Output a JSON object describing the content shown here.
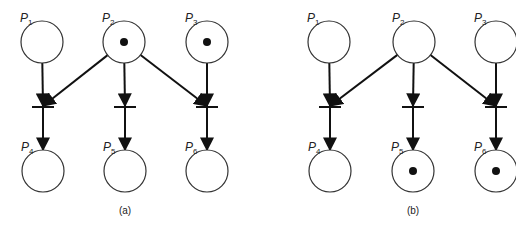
{
  "figure": {
    "width": 516,
    "height": 229,
    "colors": {
      "stroke": "#333333",
      "arc": "#111111",
      "token": "#111111",
      "background": "#ffffff"
    },
    "nets": [
      {
        "id": "a",
        "caption": "(a)",
        "caption_pos": [
          125,
          214
        ],
        "places": [
          {
            "name": "P",
            "sub": "1",
            "cx": 42,
            "cy": 42,
            "r": 21,
            "tokens": 0
          },
          {
            "name": "P",
            "sub": "2",
            "cx": 124,
            "cy": 42,
            "r": 21,
            "tokens": 1
          },
          {
            "name": "P",
            "sub": "3",
            "cx": 207,
            "cy": 42,
            "r": 21,
            "tokens": 1
          },
          {
            "name": "P",
            "sub": "4",
            "cx": 43,
            "cy": 171,
            "r": 21,
            "tokens": 0
          },
          {
            "name": "P",
            "sub": "5",
            "cx": 125,
            "cy": 171,
            "r": 21,
            "tokens": 0
          },
          {
            "name": "P",
            "sub": "6",
            "cx": 207,
            "cy": 171,
            "r": 21,
            "tokens": 0
          }
        ],
        "transitions": [
          {
            "id": "t1",
            "x": 43,
            "y": 107,
            "half_width": 11
          },
          {
            "id": "t2",
            "x": 125,
            "y": 107,
            "half_width": 11
          },
          {
            "id": "t3",
            "x": 207,
            "y": 107,
            "half_width": 11
          }
        ],
        "arcs": [
          {
            "from": "P1",
            "to": "t1"
          },
          {
            "from": "P2",
            "to": "t1"
          },
          {
            "from": "P2",
            "to": "t2"
          },
          {
            "from": "P2",
            "to": "t3"
          },
          {
            "from": "P3",
            "to": "t3"
          },
          {
            "from": "t1",
            "to": "P4"
          },
          {
            "from": "t2",
            "to": "P5"
          },
          {
            "from": "t3",
            "to": "P6"
          }
        ]
      },
      {
        "id": "b",
        "caption": "(b)",
        "caption_pos": [
          413,
          214
        ],
        "places": [
          {
            "name": "P",
            "sub": "1",
            "cx": 329,
            "cy": 42,
            "r": 21,
            "tokens": 0
          },
          {
            "name": "P",
            "sub": "2",
            "cx": 414,
            "cy": 42,
            "r": 21,
            "tokens": 0
          },
          {
            "name": "P",
            "sub": "3",
            "cx": 496,
            "cy": 42,
            "r": 21,
            "tokens": 0
          },
          {
            "name": "P",
            "sub": "4",
            "cx": 330,
            "cy": 171,
            "r": 21,
            "tokens": 0
          },
          {
            "name": "P",
            "sub": "5",
            "cx": 413,
            "cy": 171,
            "r": 21,
            "tokens": 1
          },
          {
            "name": "P",
            "sub": "6",
            "cx": 496,
            "cy": 171,
            "r": 21,
            "tokens": 1
          }
        ],
        "transitions": [
          {
            "id": "t1",
            "x": 330,
            "y": 107,
            "half_width": 11
          },
          {
            "id": "t2",
            "x": 413,
            "y": 107,
            "half_width": 11
          },
          {
            "id": "t3",
            "x": 496,
            "y": 107,
            "half_width": 11
          }
        ],
        "arcs": [
          {
            "from": "P1",
            "to": "t1"
          },
          {
            "from": "P2",
            "to": "t1"
          },
          {
            "from": "P2",
            "to": "t2"
          },
          {
            "from": "P2",
            "to": "t3"
          },
          {
            "from": "P3",
            "to": "t3"
          },
          {
            "from": "t1",
            "to": "P4"
          },
          {
            "from": "t2",
            "to": "P5"
          },
          {
            "from": "t3",
            "to": "P6"
          }
        ]
      }
    ]
  }
}
